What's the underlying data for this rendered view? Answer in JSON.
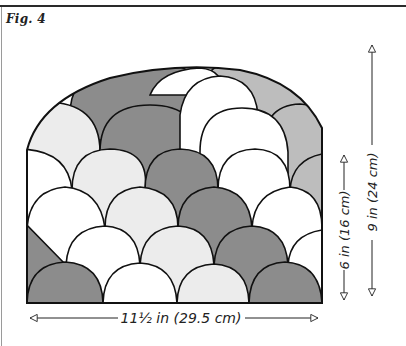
{
  "figure": {
    "label": "Fig. 4"
  },
  "dimensions": {
    "width_label": "11½ in (29.5 cm)",
    "side_height_label": "6 in (16 cm)",
    "total_height_label": "9 in (24 cm)"
  },
  "palette": {
    "dark": "#8c8c8c",
    "medium": "#bdbdbd",
    "light": "#ececec",
    "white": "#ffffff",
    "stroke": "#111111"
  }
}
